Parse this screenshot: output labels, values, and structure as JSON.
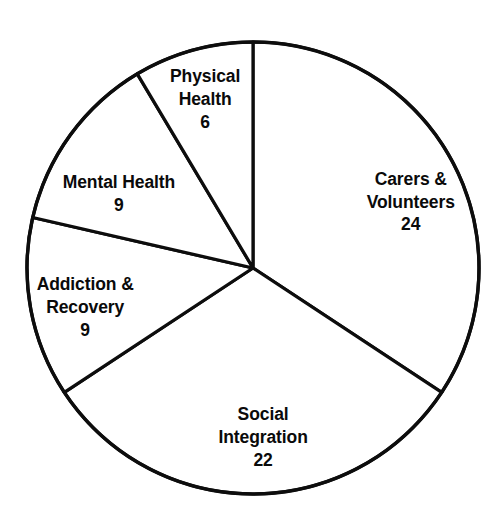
{
  "chart_data": {
    "type": "pie",
    "title": "",
    "subtitle": "",
    "xlabel": "",
    "ylabel": "",
    "legend_position": "none",
    "grid": false,
    "total": 70,
    "units": "count",
    "start_angle_deg": 0,
    "direction": "clockwise",
    "categories": [
      "Carers & Volunteers",
      "Social Integration",
      "Addiction & Recovery",
      "Mental Health",
      "Physical Health"
    ],
    "values": [
      24,
      22,
      9,
      9,
      6
    ],
    "slices": [
      {
        "label": "Carers &\nVolunteers",
        "label_line1": "Carers &",
        "label_line2": "Volunteers",
        "value": 24,
        "value_text": "24",
        "percent": 34.3,
        "start_angle_deg": 0,
        "end_angle_deg": 123.4,
        "color": "#ffffff",
        "stroke": "#0d0d0d",
        "label_x_pct": 81.5,
        "label_y_pct": 38.1
      },
      {
        "label": "Social\nIntegration",
        "label_line1": "Social",
        "label_line2": "Integration",
        "value": 22,
        "value_text": "22",
        "percent": 31.4,
        "start_angle_deg": 123.4,
        "end_angle_deg": 236.6,
        "color": "#ffffff",
        "stroke": "#0d0d0d",
        "label_x_pct": 52.2,
        "label_y_pct": 82.5
      },
      {
        "label": "Addiction &\nRecovery",
        "label_line1": "Addiction &",
        "label_line2": "Recovery",
        "value": 9,
        "value_text": "9",
        "percent": 12.9,
        "start_angle_deg": 236.6,
        "end_angle_deg": 282.9,
        "color": "#ffffff",
        "stroke": "#0d0d0d",
        "label_x_pct": 16.9,
        "label_y_pct": 58.0
      },
      {
        "label": "Mental Health",
        "label_line1": "Mental Health",
        "label_line2": "",
        "value": 9,
        "value_text": "9",
        "percent": 12.9,
        "start_angle_deg": 282.9,
        "end_angle_deg": 329.2,
        "color": "#ffffff",
        "stroke": "#0d0d0d",
        "label_x_pct": 23.6,
        "label_y_pct": 36.6
      },
      {
        "label": "Physical\nHealth",
        "label_line1": "Physical",
        "label_line2": "Health",
        "value": 6,
        "value_text": "6",
        "percent": 8.6,
        "start_angle_deg": 329.2,
        "end_angle_deg": 360,
        "color": "#ffffff",
        "stroke": "#0d0d0d",
        "label_x_pct": 40.7,
        "label_y_pct": 18.7
      }
    ],
    "geometry": {
      "center_x": 253,
      "center_y": 268,
      "radius": 226
    },
    "colors": {
      "slice_fill": "#ffffff",
      "outline": "#0d0d0d",
      "label_text": "#0a0a0a",
      "background": "#ffffff"
    }
  }
}
